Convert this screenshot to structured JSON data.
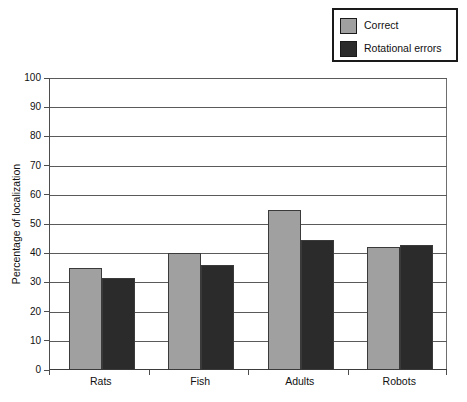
{
  "chart_data": {
    "type": "bar",
    "title": "",
    "subtitle": "",
    "xlabel": "",
    "ylabel": "Percentage of localization",
    "categories": [
      "Rats",
      "Fish",
      "Adults",
      "Robots"
    ],
    "series": [
      {
        "name": "Correct",
        "color": "#a0a0a0",
        "values": [
          35.0,
          40.0,
          54.8,
          42.0
        ]
      },
      {
        "name": "Rotational errors",
        "color": "#2b2b2b",
        "values": [
          31.5,
          35.8,
          44.5,
          42.7
        ]
      }
    ],
    "ylim": [
      0,
      100
    ],
    "ytick_step": 10,
    "yticks": [
      0,
      10,
      20,
      30,
      40,
      50,
      60,
      70,
      80,
      90,
      100
    ],
    "ytick_labels": [
      "0",
      "10",
      "20",
      "30",
      "40",
      "50",
      "60",
      "70",
      "80",
      "90",
      "100"
    ],
    "grid": {
      "horizontal": true,
      "vertical": false
    },
    "legend": {
      "position": "top-right",
      "boxed": true
    },
    "annotations": []
  },
  "legend": {
    "entries": [
      {
        "label": "Correct",
        "color": "#a0a0a0"
      },
      {
        "label": "Rotational errors",
        "color": "#2b2b2b"
      }
    ]
  },
  "axes": {
    "y_title": "Percentage of localization"
  },
  "colors": {
    "correct": "#a0a0a0",
    "rotational_errors": "#2b2b2b",
    "axis": "#4d4d4d",
    "gridline": "#5a5a5a",
    "text": "#111111",
    "background": "#ffffff"
  }
}
